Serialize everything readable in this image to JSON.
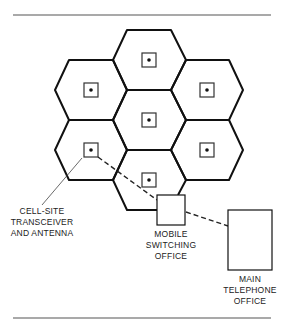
{
  "diagram": {
    "type": "cellular network",
    "labels": {
      "cell_site": [
        "CELL-SITE",
        "TRANSCEIVER",
        "AND ANTENNA"
      ],
      "mobile_switching": [
        "MOBILE",
        "SWITCHING",
        "OFFICE"
      ],
      "main_telephone": [
        "MAIN",
        "TELEPHONE",
        "OFFICE"
      ]
    },
    "cells": 7,
    "colors": {
      "line": "#111111",
      "background": "#ffffff"
    }
  }
}
